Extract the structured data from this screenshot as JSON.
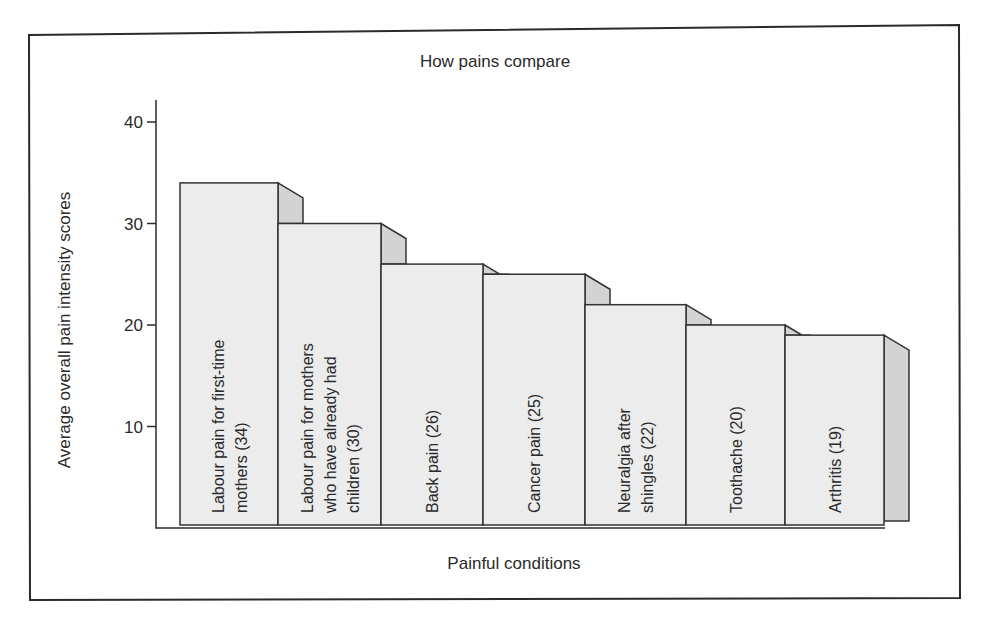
{
  "chart_data": {
    "type": "bar",
    "title": "How pains compare",
    "xlabel": "Painful conditions",
    "ylabel": "Average overall pain intensity scores",
    "ylim": [
      0,
      42
    ],
    "yticks": [
      10,
      20,
      30,
      40
    ],
    "grid": false,
    "legend": null,
    "style": "3d-stepped-bars",
    "categories": [
      "Labour pain for first-time mothers",
      "Labour pain for mothers who have already had children",
      "Back pain",
      "Cancer pain",
      "Neuralgia after shingles",
      "Toothache",
      "Arthritis"
    ],
    "values": [
      34,
      30,
      26,
      25,
      22,
      20,
      19
    ],
    "bar_labels": [
      [
        "Labour pain for first-time",
        "mothers (34)"
      ],
      [
        "Labour pain for mothers",
        "who have already had",
        "children (30)"
      ],
      [
        "Back pain (26)"
      ],
      [
        "Cancer pain (25)"
      ],
      [
        "Neuralgia after",
        "shingles (22)"
      ],
      [
        "Toothache (20)"
      ],
      [
        "Arthritis (19)"
      ]
    ]
  },
  "colors": {
    "bar_front": "#ececec",
    "bar_side": "#d3d3d3",
    "outline": "#333333",
    "background": "#ffffff"
  }
}
